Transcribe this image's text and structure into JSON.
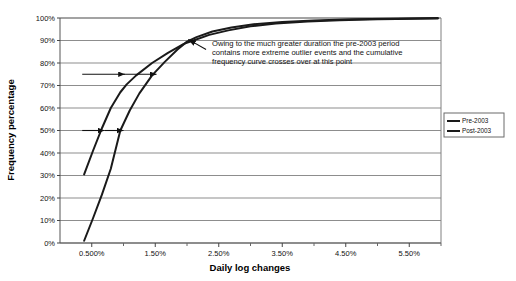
{
  "chart_data": {
    "type": "line",
    "title": "",
    "xlabel": "Daily log changes",
    "ylabel": "Frequency percentage",
    "xlim": [
      0.0,
      6.0
    ],
    "ylim": [
      0,
      100
    ],
    "grid": true,
    "grid_axis": "y",
    "legend_position": "right",
    "x_tick_labels": [
      "0.500%",
      "1.50%",
      "2.50%",
      "3.50%",
      "4.50%",
      "5.50%"
    ],
    "x_tick_values": [
      0.5,
      1.5,
      2.5,
      3.5,
      4.5,
      5.5
    ],
    "x_minor_ticks": [
      1.0,
      2.0,
      3.0,
      4.0,
      5.0,
      6.0
    ],
    "y_tick_labels": [
      "0%",
      "10%",
      "20%",
      "30%",
      "40%",
      "50%",
      "60%",
      "70%",
      "80%",
      "90%",
      "100%"
    ],
    "y_tick_values": [
      0,
      10,
      20,
      30,
      40,
      50,
      60,
      70,
      80,
      90,
      100
    ],
    "series": [
      {
        "name": "Pre-2003",
        "color": "#1a1a1a",
        "x": [
          0.38,
          0.52,
          0.66,
          0.8,
          0.95,
          1.05,
          1.2,
          1.45,
          1.7,
          1.95,
          2.1,
          2.35,
          2.65,
          3.0,
          3.4,
          3.9,
          4.4,
          5.0,
          5.6,
          5.95
        ],
        "y": [
          30.5,
          41.0,
          51.0,
          60.0,
          67.0,
          70.5,
          74.5,
          80.0,
          84.5,
          88.5,
          90.0,
          92.5,
          94.5,
          96.3,
          97.6,
          98.5,
          99.0,
          99.4,
          99.7,
          99.8
        ]
      },
      {
        "name": "Post-2003",
        "color": "#1a1a1a",
        "x": [
          0.38,
          0.52,
          0.66,
          0.8,
          0.95,
          1.1,
          1.25,
          1.45,
          1.65,
          1.85,
          2.0,
          2.15,
          2.4,
          2.7,
          3.05,
          3.5,
          4.0,
          4.6,
          5.2,
          5.95
        ],
        "y": [
          1.0,
          11.0,
          21.5,
          33.0,
          50.0,
          59.0,
          66.5,
          74.5,
          80.5,
          86.0,
          89.5,
          91.5,
          94.0,
          95.8,
          97.2,
          98.2,
          98.9,
          99.4,
          99.7,
          100.0
        ]
      }
    ],
    "annotations": [
      {
        "name": "crossover-note",
        "text_lines": [
          "Owing to the much greater duration the pre-2003 period",
          "contains more extreme outlier events and the cumulative",
          "frequency curve crosses over at this point"
        ],
        "arrow_from_x": 2.3,
        "arrow_from_y": 86.0,
        "arrow_to_x": 2.02,
        "arrow_to_y": 90.5
      },
      {
        "name": "reference-arrow-75",
        "level": 75,
        "from_x": 1.0,
        "to_x": 1.52
      },
      {
        "name": "reference-arrow-75-left",
        "level": 75,
        "from_x": 0.35,
        "to_x": 1.02
      },
      {
        "name": "reference-arrow-50",
        "level": 50,
        "from_x": 0.35,
        "to_x": 0.7
      },
      {
        "name": "reference-arrow-50-right",
        "level": 50,
        "from_x": 0.7,
        "to_x": 1.0
      }
    ]
  },
  "legend": {
    "items": [
      {
        "label": "Pre-2003",
        "color": "#1a1a1a"
      },
      {
        "label": "Post-2003",
        "color": "#1a1a1a"
      }
    ]
  },
  "axes": {
    "x_title": "Daily log changes",
    "y_title": "Frequency percentage"
  }
}
